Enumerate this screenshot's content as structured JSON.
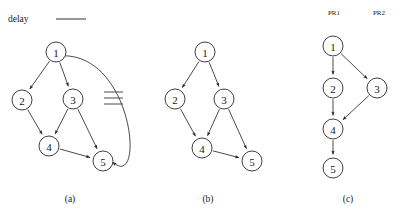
{
  "legend": {
    "label": "delay",
    "line_icon": "horizontal-rule-icon",
    "line_color": "#6a6a6a"
  },
  "style": {
    "node_fill": "#ffffff",
    "node_stroke": "#2a2a2a",
    "edge_color": "#2a2a2a",
    "background": "#ffffff",
    "node_radius": 10
  },
  "panels": [
    {
      "id": "a",
      "caption": "(a)",
      "caption_pos": {
        "x": 70,
        "y": 199
      },
      "nodes": [
        {
          "id": "1",
          "label": "1",
          "x": 56,
          "y": 52
        },
        {
          "id": "2",
          "label": "2",
          "x": 22,
          "y": 100
        },
        {
          "id": "3",
          "label": "3",
          "x": 73,
          "y": 99
        },
        {
          "id": "4",
          "label": "4",
          "x": 49,
          "y": 146
        },
        {
          "id": "5",
          "label": "5",
          "x": 103,
          "y": 161
        }
      ],
      "edges": [
        {
          "from": "1",
          "to": "2",
          "kind": "straight",
          "arrow": true
        },
        {
          "from": "1",
          "to": "3",
          "kind": "straight",
          "arrow": true
        },
        {
          "from": "2",
          "to": "4",
          "kind": "straight",
          "arrow": true
        },
        {
          "from": "3",
          "to": "4",
          "kind": "straight",
          "arrow": true
        },
        {
          "from": "3",
          "to": "5",
          "kind": "straight",
          "arrow": true
        },
        {
          "from": "4",
          "to": "5",
          "kind": "straight",
          "arrow": true
        },
        {
          "from": "5",
          "to": "1",
          "kind": "curved",
          "arrow": true,
          "annotated": "delay"
        }
      ],
      "hatch": {
        "name": "delay-hatch-marks",
        "count": 3,
        "x1": 104,
        "x2": 123,
        "ys": [
          92,
          98,
          104
        ]
      }
    },
    {
      "id": "b",
      "caption": "(b)",
      "caption_pos": {
        "x": 208,
        "y": 199
      },
      "nodes": [
        {
          "id": "1",
          "label": "1",
          "x": 205,
          "y": 52
        },
        {
          "id": "2",
          "label": "2",
          "x": 175,
          "y": 99
        },
        {
          "id": "3",
          "label": "3",
          "x": 224,
          "y": 99
        },
        {
          "id": "4",
          "label": "4",
          "x": 202,
          "y": 148
        },
        {
          "id": "5",
          "label": "5",
          "x": 252,
          "y": 161
        }
      ],
      "edges": [
        {
          "from": "1",
          "to": "2",
          "kind": "straight",
          "arrow": true
        },
        {
          "from": "1",
          "to": "3",
          "kind": "straight",
          "arrow": true
        },
        {
          "from": "2",
          "to": "4",
          "kind": "straight",
          "arrow": true
        },
        {
          "from": "3",
          "to": "4",
          "kind": "straight",
          "arrow": true
        },
        {
          "from": "3",
          "to": "5",
          "kind": "straight",
          "arrow": true
        },
        {
          "from": "4",
          "to": "5",
          "kind": "straight",
          "arrow": true
        }
      ],
      "hatch": null
    },
    {
      "id": "c",
      "caption": "(c)",
      "caption_pos": {
        "x": 348,
        "y": 199
      },
      "column_labels": [
        {
          "text": "PR1",
          "x": 334,
          "y": 13
        },
        {
          "text": "PR2",
          "x": 379,
          "y": 13
        }
      ],
      "nodes": [
        {
          "id": "1",
          "label": "1",
          "x": 333,
          "y": 46
        },
        {
          "id": "2",
          "label": "2",
          "x": 333,
          "y": 88
        },
        {
          "id": "3",
          "label": "3",
          "x": 377,
          "y": 88
        },
        {
          "id": "4",
          "label": "4",
          "x": 333,
          "y": 129
        },
        {
          "id": "5",
          "label": "5",
          "x": 333,
          "y": 168
        }
      ],
      "edges": [
        {
          "from": "1",
          "to": "2",
          "kind": "straight",
          "arrow": true
        },
        {
          "from": "1",
          "to": "3",
          "kind": "straight",
          "arrow": true
        },
        {
          "from": "2",
          "to": "4",
          "kind": "straight",
          "arrow": true
        },
        {
          "from": "3",
          "to": "4",
          "kind": "straight",
          "arrow": true
        },
        {
          "from": "4",
          "to": "5",
          "kind": "straight",
          "arrow": true
        }
      ],
      "hatch": null
    }
  ]
}
